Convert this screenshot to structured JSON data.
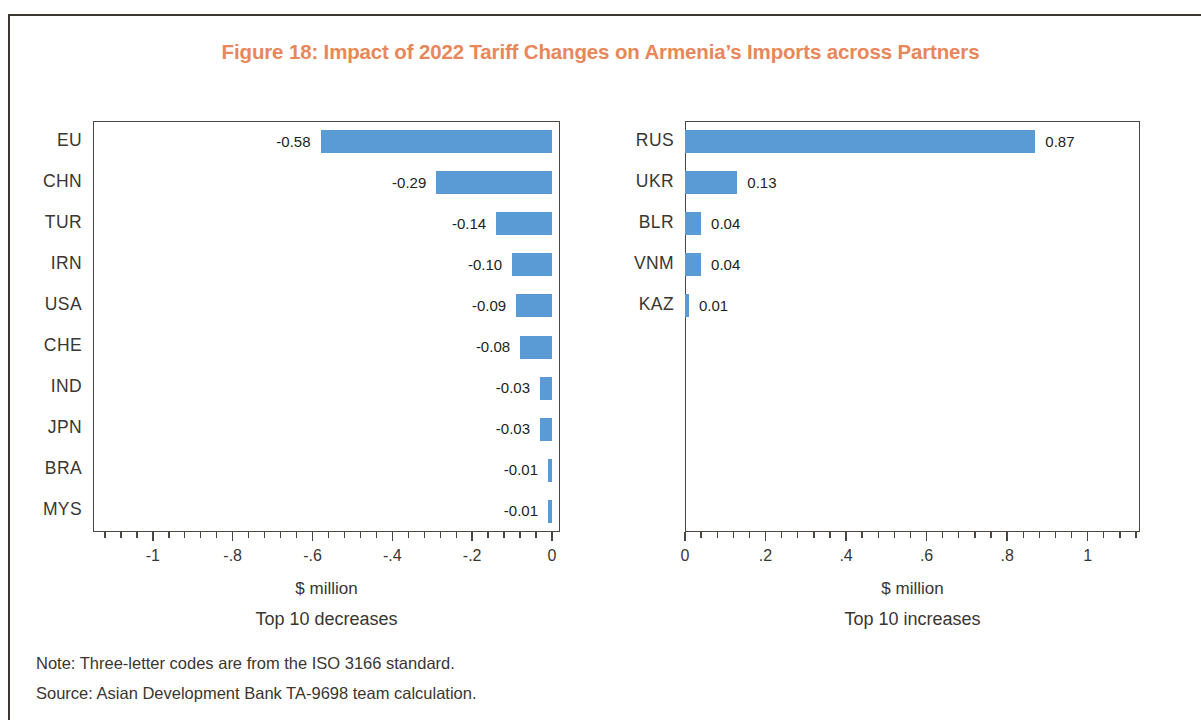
{
  "figure": {
    "title": "Figure 18: Impact of 2022 Tariff Changes on Armenia’s Imports across Partners",
    "title_color": "#e8875a",
    "bar_color": "#5b9bd5",
    "note": "Note: Three-letter codes are from the ISO 3166 standard.",
    "source": "Source: Asian Development Bank TA-9698 team calculation."
  },
  "chart_data": [
    {
      "type": "bar",
      "orientation": "horizontal",
      "title": "Top 10 decreases",
      "xlabel": "$ million",
      "ylabel": "",
      "xlim": [
        -1.15,
        0.02
      ],
      "xticks": [
        -1,
        -0.8,
        -0.6,
        -0.4,
        -0.2,
        0
      ],
      "xticklabels": [
        "-1",
        "-.8",
        "-.6",
        "-.4",
        "-.2",
        "0"
      ],
      "grid": false,
      "legend": "none",
      "categories": [
        "EU",
        "CHN",
        "TUR",
        "IRN",
        "USA",
        "CHE",
        "IND",
        "JPN",
        "BRA",
        "MYS"
      ],
      "values": [
        -0.58,
        -0.29,
        -0.14,
        -0.1,
        -0.09,
        -0.08,
        -0.03,
        -0.03,
        -0.01,
        -0.01
      ],
      "datalabels": [
        "-0.58",
        "-0.29",
        "-0.14",
        "-0.10",
        "-0.09",
        "-0.08",
        "-0.03",
        "-0.03",
        "-0.01",
        "-0.01"
      ]
    },
    {
      "type": "bar",
      "orientation": "horizontal",
      "title": "Top 10 increases",
      "xlabel": "$ million",
      "ylabel": "",
      "xlim": [
        0,
        1.13
      ],
      "xticks": [
        0,
        0.2,
        0.4,
        0.6,
        0.8,
        1
      ],
      "xticklabels": [
        "0",
        ".2",
        ".4",
        ".6",
        ".8",
        "1"
      ],
      "grid": false,
      "legend": "none",
      "categories": [
        "RUS",
        "UKR",
        "BLR",
        "VNM",
        "KAZ"
      ],
      "values": [
        0.87,
        0.13,
        0.04,
        0.04,
        0.01
      ],
      "datalabels": [
        "0.87",
        "0.13",
        "0.04",
        "0.04",
        "0.01"
      ]
    }
  ]
}
